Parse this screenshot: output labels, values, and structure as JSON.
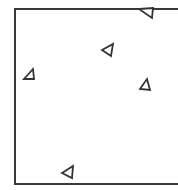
{
  "diagram": {
    "frame": {
      "left": 14,
      "top": 8,
      "bottom": 183,
      "stroke": "#3a3a3a"
    },
    "stroke_color": "#333333",
    "markers": [
      {
        "id": "marker-1",
        "shape": "triangle",
        "points": "139,9 153,8 152,18"
      },
      {
        "id": "marker-2",
        "shape": "triangle",
        "points": "102,50 113,44 111,56"
      },
      {
        "id": "marker-3",
        "shape": "triangle",
        "points": "24,79 33,69 34,79"
      },
      {
        "id": "marker-4",
        "shape": "triangle",
        "points": "140,89 147,79 150,90"
      },
      {
        "id": "marker-5",
        "shape": "triangle",
        "points": "62,173 73,166 72,178"
      }
    ]
  }
}
